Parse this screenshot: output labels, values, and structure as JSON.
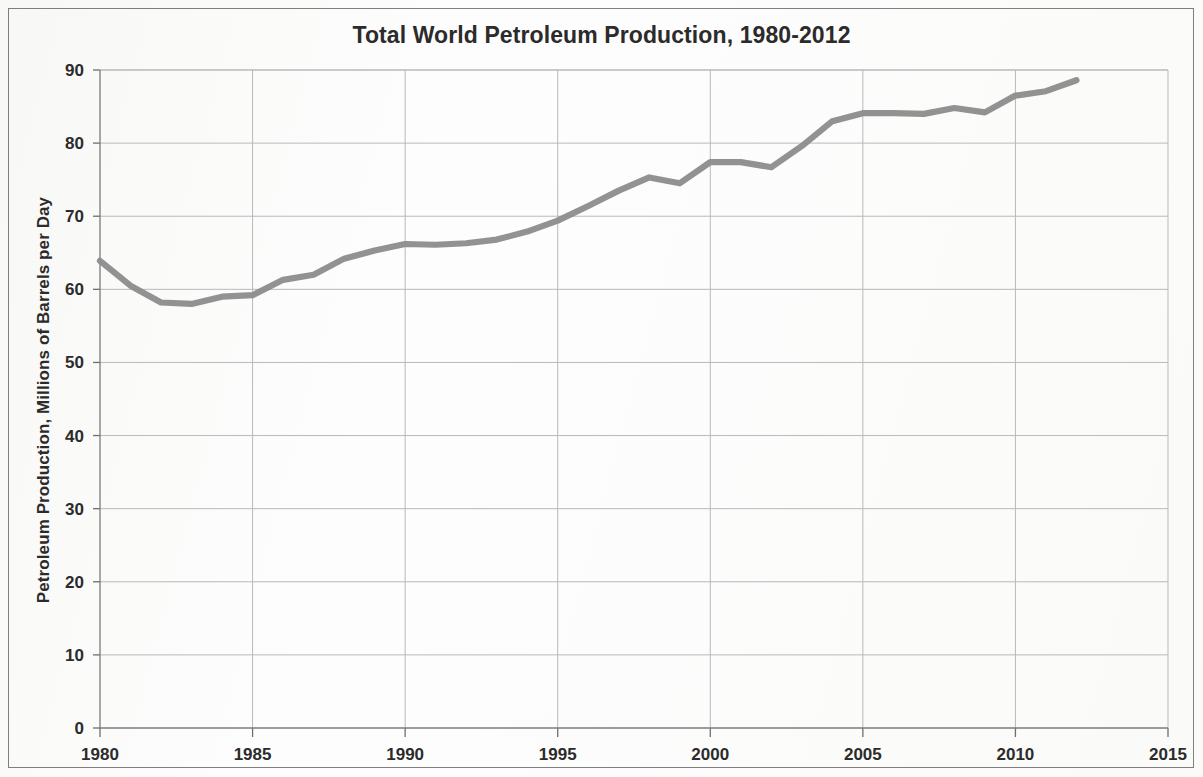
{
  "chart_data": {
    "type": "line",
    "title": "Total World Petroleum Production, 1980-2012",
    "xlabel": "",
    "ylabel": "Petroleum Production, Millions of Barrels per Day",
    "xlim": [
      1980,
      2015
    ],
    "ylim": [
      0,
      90
    ],
    "x_ticks": [
      1980,
      1985,
      1990,
      1995,
      2000,
      2005,
      2010,
      2015
    ],
    "y_ticks": [
      0,
      10,
      20,
      30,
      40,
      50,
      60,
      70,
      80,
      90
    ],
    "grid": true,
    "legend": "none",
    "line_color": "#8c8c8c",
    "x": [
      1980,
      1981,
      1982,
      1983,
      1984,
      1985,
      1986,
      1987,
      1988,
      1989,
      1990,
      1991,
      1992,
      1993,
      1994,
      1995,
      1996,
      1997,
      1998,
      1999,
      2000,
      2001,
      2002,
      2003,
      2004,
      2005,
      2006,
      2007,
      2008,
      2009,
      2010,
      2011,
      2012
    ],
    "series": [
      {
        "name": "Total World Petroleum Production",
        "values": [
          63.9,
          60.5,
          58.2,
          58.0,
          59.0,
          59.2,
          61.3,
          62.0,
          64.2,
          65.3,
          66.2,
          66.1,
          66.3,
          66.8,
          67.9,
          69.4,
          71.4,
          73.5,
          75.3,
          74.5,
          77.4,
          77.4,
          76.7,
          79.6,
          83.0,
          84.1,
          84.1,
          84.0,
          84.8,
          84.2,
          86.5,
          87.1,
          88.6
        ]
      }
    ]
  }
}
